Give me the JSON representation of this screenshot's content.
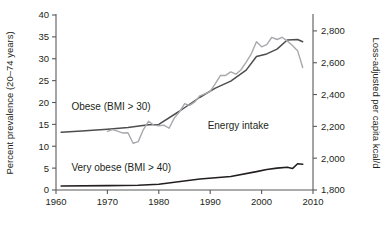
{
  "chart_data": {
    "type": "line",
    "title": "",
    "xlabel": "",
    "ylabel": "Percent prevalence (20–74 years)",
    "y2label": "Loss-adjusted per capita kcal/d",
    "xlim": [
      1960,
      2010
    ],
    "ylim": [
      0,
      40
    ],
    "y2lim": [
      1800,
      2900
    ],
    "grid": false,
    "legend": "inline-annotations",
    "xticks": [
      1960,
      1970,
      1980,
      1990,
      2000,
      2010
    ],
    "xtick_labels": [
      "1960",
      "1970",
      "1980",
      "1990",
      "2000",
      "2010"
    ],
    "yticks": [
      0,
      5,
      10,
      15,
      20,
      25,
      30,
      35,
      40
    ],
    "ytick_labels": [
      "0",
      "5",
      "10",
      "15",
      "20",
      "25",
      "30",
      "35",
      "40"
    ],
    "y2ticks": [
      1800,
      2000,
      2200,
      2400,
      2600,
      2800
    ],
    "y2tick_labels": [
      "1,800",
      "2,000",
      "2,200",
      "2,400",
      "2,600",
      "2,800"
    ],
    "series": [
      {
        "name": "Obese (BMI > 30)",
        "axis": "left",
        "color": "#4d4d4d",
        "width": 1.5,
        "label_x": 1963.0,
        "label_y": 18.4,
        "points": [
          [
            1961,
            13.2
          ],
          [
            1965,
            13.5
          ],
          [
            1970,
            13.9
          ],
          [
            1974,
            14.3
          ],
          [
            1978,
            14.9
          ],
          [
            1980,
            15.0
          ],
          [
            1984,
            18.0
          ],
          [
            1988,
            21.2
          ],
          [
            1991,
            23.3
          ],
          [
            1994,
            24.9
          ],
          [
            1997,
            27.4
          ],
          [
            1999,
            30.5
          ],
          [
            2001,
            31.1
          ],
          [
            2003,
            32.2
          ],
          [
            2005,
            34.3
          ],
          [
            2007,
            34.4
          ],
          [
            2008,
            33.9
          ]
        ]
      },
      {
        "name": "Energy intake",
        "axis": "right",
        "color": "#a7a9ac",
        "width": 1.4,
        "label_x": 1989.5,
        "label_y": 14.0,
        "points": [
          [
            1970,
            2168
          ],
          [
            1971,
            2180
          ],
          [
            1972,
            2170
          ],
          [
            1973,
            2158
          ],
          [
            1974,
            2160
          ],
          [
            1975,
            2094
          ],
          [
            1976,
            2104
          ],
          [
            1977,
            2180
          ],
          [
            1978,
            2232
          ],
          [
            1979,
            2208
          ],
          [
            1980,
            2204
          ],
          [
            1981,
            2208
          ],
          [
            1982,
            2188
          ],
          [
            1983,
            2252
          ],
          [
            1984,
            2290
          ],
          [
            1985,
            2342
          ],
          [
            1986,
            2332
          ],
          [
            1987,
            2354
          ],
          [
            1988,
            2392
          ],
          [
            1989,
            2404
          ],
          [
            1990,
            2420
          ],
          [
            1991,
            2468
          ],
          [
            1992,
            2520
          ],
          [
            1993,
            2520
          ],
          [
            1994,
            2542
          ],
          [
            1995,
            2528
          ],
          [
            1996,
            2556
          ],
          [
            1997,
            2604
          ],
          [
            1998,
            2656
          ],
          [
            1999,
            2732
          ],
          [
            2000,
            2700
          ],
          [
            2001,
            2714
          ],
          [
            2002,
            2760
          ],
          [
            2003,
            2746
          ],
          [
            2004,
            2760
          ],
          [
            2005,
            2736
          ],
          [
            2006,
            2708
          ],
          [
            2007,
            2676
          ],
          [
            2008,
            2570
          ]
        ]
      },
      {
        "name": "Very obese (BMI > 40)",
        "axis": "left",
        "color": "#231f20",
        "width": 1.6,
        "label_x": 1963.0,
        "label_y": 4.3,
        "points": [
          [
            1961,
            0.9
          ],
          [
            1970,
            1.0
          ],
          [
            1976,
            1.1
          ],
          [
            1980,
            1.3
          ],
          [
            1988,
            2.5
          ],
          [
            1994,
            3.1
          ],
          [
            1999,
            4.2
          ],
          [
            2001,
            4.7
          ],
          [
            2003,
            5.0
          ],
          [
            2005,
            5.2
          ],
          [
            2006,
            4.9
          ],
          [
            2007,
            6.0
          ],
          [
            2008,
            5.9
          ]
        ]
      }
    ]
  }
}
